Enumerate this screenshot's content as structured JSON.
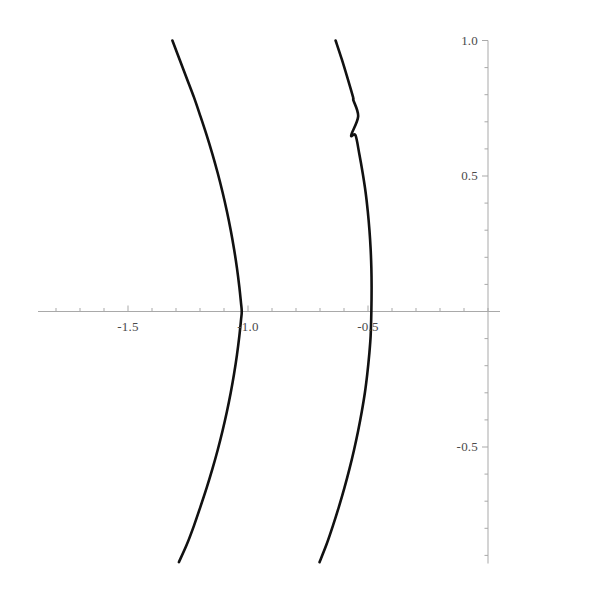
{
  "chart_data": {
    "type": "line",
    "title": "",
    "subtitle": "",
    "xlabel": "",
    "ylabel": "",
    "xlim": [
      -1.9,
      0.05
    ],
    "ylim": [
      -0.93,
      1.0
    ],
    "grid": false,
    "legend": null,
    "axis_style": "crosshair-axes-with-ticks",
    "curve_color": "#111111",
    "axis_color": "#a9a9a9",
    "label_color": "#4a4a4a",
    "x_axis_position_value": 0.0,
    "y_axis_position_value": 0.0,
    "x_major_ticks": [
      -1.5,
      -1.0,
      -0.5
    ],
    "x_major_tick_labels": [
      "-1.5",
      "-1.0",
      "-0.5"
    ],
    "x_minor_tick_step": 0.1,
    "x_axis_start_value": -1.875,
    "x_axis_end_value": 0.05,
    "y_major_ticks": [
      1.0,
      0.5,
      -0.5
    ],
    "y_major_tick_labels": [
      "1.0",
      "0.5",
      "-0.5"
    ],
    "y_minor_tick_step": 0.1,
    "y_axis_start_value": -0.93,
    "y_axis_end_value": 1.0,
    "series": [
      {
        "name": "left-branch",
        "description": "left branch of hyperbola-like curve, vertex near x = -1.02 at y = 0",
        "points": [
          [
            -1.315,
            1.0
          ],
          [
            -1.285,
            0.93
          ],
          [
            -1.255,
            0.86
          ],
          [
            -1.225,
            0.79
          ],
          [
            -1.198,
            0.72
          ],
          [
            -1.172,
            0.65
          ],
          [
            -1.148,
            0.58
          ],
          [
            -1.126,
            0.51
          ],
          [
            -1.106,
            0.44
          ],
          [
            -1.088,
            0.37
          ],
          [
            -1.072,
            0.3
          ],
          [
            -1.058,
            0.23
          ],
          [
            -1.046,
            0.16
          ],
          [
            -1.036,
            0.09
          ],
          [
            -1.029,
            0.03
          ],
          [
            -1.026,
            0.0
          ],
          [
            -1.029,
            -0.03
          ],
          [
            -1.036,
            -0.09
          ],
          [
            -1.046,
            -0.16
          ],
          [
            -1.058,
            -0.23
          ],
          [
            -1.072,
            -0.3
          ],
          [
            -1.088,
            -0.37
          ],
          [
            -1.106,
            -0.44
          ],
          [
            -1.126,
            -0.51
          ],
          [
            -1.148,
            -0.58
          ],
          [
            -1.172,
            -0.65
          ],
          [
            -1.198,
            -0.72
          ],
          [
            -1.225,
            -0.79
          ],
          [
            -1.255,
            -0.86
          ],
          [
            -1.288,
            -0.925
          ]
        ]
      },
      {
        "name": "right-branch",
        "description": "right branch of hyperbola-like curve, vertex near x = -0.51 at y = 0",
        "points": [
          [
            -0.635,
            1.0
          ],
          [
            -0.609,
            0.93
          ],
          [
            -0.585,
            0.86
          ],
          [
            -0.562,
            0.79
          ],
          [
            -0.561,
            0.78
          ],
          [
            -0.541,
            0.72
          ],
          [
            -0.57,
            0.65
          ],
          [
            -0.552,
            0.65
          ],
          [
            -0.536,
            0.58
          ],
          [
            -0.522,
            0.51
          ],
          [
            -0.51,
            0.44
          ],
          [
            -0.501,
            0.37
          ],
          [
            -0.494,
            0.3
          ],
          [
            -0.489,
            0.23
          ],
          [
            -0.486,
            0.16
          ],
          [
            -0.485,
            0.09
          ],
          [
            -0.486,
            0.0
          ],
          [
            -0.489,
            -0.09
          ],
          [
            -0.495,
            -0.16
          ],
          [
            -0.503,
            -0.23
          ],
          [
            -0.513,
            -0.3
          ],
          [
            -0.526,
            -0.37
          ],
          [
            -0.541,
            -0.44
          ],
          [
            -0.558,
            -0.51
          ],
          [
            -0.577,
            -0.58
          ],
          [
            -0.598,
            -0.65
          ],
          [
            -0.621,
            -0.72
          ],
          [
            -0.646,
            -0.79
          ],
          [
            -0.673,
            -0.86
          ],
          [
            -0.702,
            -0.925
          ]
        ]
      }
    ]
  }
}
